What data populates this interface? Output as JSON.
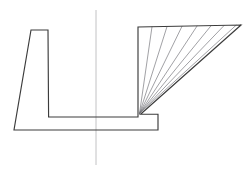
{
  "figure": {
    "title": "Technical cross-section line drawing",
    "type": "engineering-line-drawing",
    "canvas": {
      "width": 252,
      "height": 175,
      "background": "#ffffff"
    },
    "style": {
      "outline_color": "#3c3c3c",
      "outline_width": 1.15,
      "fan_color": "#6e6e74",
      "fan_width": 0.65,
      "centerline_color": "#c2c2c4",
      "centerline_width": 1.0
    }
  },
  "centerline": {
    "label": "vertical-centerline",
    "x": 96,
    "y_top": 10,
    "y_bottom": 165,
    "path": "M 96 10 L 96 165"
  },
  "profile": {
    "label": "section-outline",
    "description": "Closed polygon: tapered left column, U-shaped channel floor, tall right wall, sloped upper-right face, stepped lower-right return.",
    "vertices": [
      {
        "name": "left-column-top-left",
        "x": 31,
        "y": 30
      },
      {
        "name": "left-column-top-right",
        "x": 48,
        "y": 30
      },
      {
        "name": "left-column-inner-bottom",
        "x": 49,
        "y": 117
      },
      {
        "name": "channel-floor-right",
        "x": 138,
        "y": 117
      },
      {
        "name": "fan-apex",
        "x": 138,
        "y": 113
      },
      {
        "name": "right-wall-top",
        "x": 138,
        "y": 27
      },
      {
        "name": "top-right-vertex",
        "x": 241,
        "y": 25
      },
      {
        "name": "slope-bottom-at-apex",
        "x": 140,
        "y": 115
      },
      {
        "name": "step-outer-corner",
        "x": 158,
        "y": 130
      },
      {
        "name": "bottom-edge-left",
        "x": 14,
        "y": 130
      },
      {
        "name": "left-taper-foot",
        "x": 14,
        "y": 130
      }
    ],
    "path": "M 31 30 L 48 30 L 48.6 117 L 138 117 L 138 27 L 241 25 L 140.5 114.2 L 158 114.2 L 158 130 L 14 130 Z",
    "segments": [
      {
        "name": "left-column-top-edge",
        "from": "left-column-top-left",
        "to": "left-column-top-right"
      },
      {
        "name": "left-column-inner-wall",
        "from": "left-column-top-right",
        "to": "left-column-inner-bottom"
      },
      {
        "name": "channel-floor",
        "from": "left-column-inner-bottom",
        "to": "channel-floor-right"
      },
      {
        "name": "right-wall",
        "from": "channel-floor-right",
        "to": "right-wall-top"
      },
      {
        "name": "top-edge-right",
        "from": "right-wall-top",
        "to": "top-right-vertex"
      },
      {
        "name": "sloped-face",
        "from": "top-right-vertex",
        "to": "fan-apex"
      },
      {
        "name": "step-return",
        "from": "fan-apex",
        "to": "step-outer-corner"
      },
      {
        "name": "bottom-edge",
        "from": "step-outer-corner",
        "to": "bottom-edge-left"
      },
      {
        "name": "left-taper-face",
        "from": "bottom-edge-left",
        "to": "left-column-top-left"
      }
    ]
  },
  "fan": {
    "label": "radial-hatch-fan",
    "description": "Seven construction lines radiating from the apex to points along the top edge.",
    "apex": {
      "x": 139.5,
      "y": 113.5
    },
    "count": 7,
    "rays": [
      {
        "index": 1,
        "to_x": 152,
        "to_y": 26.8
      },
      {
        "index": 2,
        "to_x": 167,
        "to_y": 26.6
      },
      {
        "index": 3,
        "to_x": 182,
        "to_y": 26.3
      },
      {
        "index": 4,
        "to_x": 197,
        "to_y": 26.1
      },
      {
        "index": 5,
        "to_x": 211,
        "to_y": 25.8
      },
      {
        "index": 6,
        "to_x": 224,
        "to_y": 25.6
      },
      {
        "index": 7,
        "to_x": 236,
        "to_y": 25.3
      }
    ]
  }
}
